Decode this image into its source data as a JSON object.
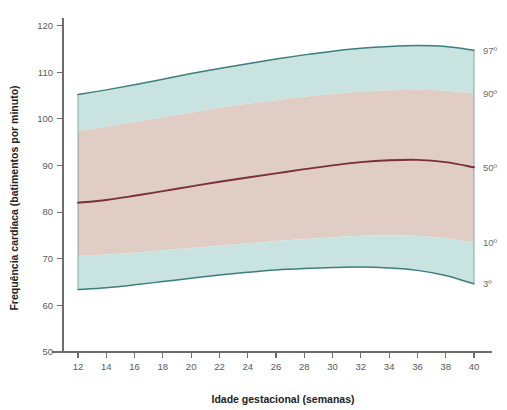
{
  "chart_data": {
    "type": "area",
    "title": "",
    "xlabel": "Idade gestacional (semanas)",
    "ylabel": "Frequência cardíaca (batimentos por minuto)",
    "xlim": [
      11,
      41
    ],
    "ylim": [
      50,
      122
    ],
    "xticks": [
      12,
      14,
      16,
      18,
      20,
      22,
      24,
      26,
      28,
      30,
      32,
      34,
      36,
      38,
      40
    ],
    "yticks": [
      50,
      60,
      70,
      80,
      90,
      100,
      110,
      120
    ],
    "grid": false,
    "legend_position": "right-axis-annotations",
    "x": [
      12,
      14,
      16,
      18,
      20,
      22,
      24,
      26,
      28,
      30,
      32,
      34,
      36,
      38,
      40
    ],
    "series": [
      {
        "name": "97º",
        "label": "97º",
        "color": "#3d7d7d",
        "kind": "band-upper-outer",
        "values": [
          105.2,
          106.2,
          107.3,
          108.5,
          109.7,
          110.8,
          111.8,
          112.8,
          113.7,
          114.5,
          115.1,
          115.5,
          115.7,
          115.5,
          114.7
        ]
      },
      {
        "name": "90º",
        "label": "90º",
        "color": "#3d7d7d",
        "kind": "band-upper-inner",
        "values": [
          97.4,
          98.3,
          99.3,
          100.3,
          101.3,
          102.3,
          103.2,
          104.0,
          104.7,
          105.3,
          105.8,
          106.1,
          106.2,
          106.0,
          105.4
        ]
      },
      {
        "name": "50º",
        "label": "50º",
        "color": "#7a2f3a",
        "kind": "median",
        "values": [
          82.0,
          82.6,
          83.5,
          84.5,
          85.5,
          86.5,
          87.4,
          88.3,
          89.2,
          90.0,
          90.7,
          91.1,
          91.2,
          90.7,
          89.6
        ]
      },
      {
        "name": "10º",
        "label": "10º",
        "color": "#3d7d7d",
        "kind": "band-lower-inner",
        "values": [
          70.6,
          70.9,
          71.3,
          71.8,
          72.3,
          72.8,
          73.3,
          73.8,
          74.2,
          74.6,
          74.9,
          75.0,
          74.9,
          74.4,
          73.4
        ]
      },
      {
        "name": "3º",
        "label": "3º",
        "color": "#3d7d7d",
        "kind": "band-lower-outer",
        "values": [
          63.4,
          63.8,
          64.4,
          65.1,
          65.8,
          66.5,
          67.1,
          67.6,
          67.9,
          68.1,
          68.2,
          68.0,
          67.5,
          66.4,
          64.6
        ]
      }
    ],
    "band_fills": {
      "outer": "#c9e4e0",
      "inner": "#e0cdc6"
    },
    "annotations": [
      {
        "name": "percentile-97",
        "text": "97º",
        "at_week": 40,
        "value": 114.7
      },
      {
        "name": "percentile-90",
        "text": "90º",
        "at_week": 40,
        "value": 105.4
      },
      {
        "name": "percentile-50",
        "text": "50º",
        "at_week": 40,
        "value": 89.6
      },
      {
        "name": "percentile-10",
        "text": "10º",
        "at_week": 40,
        "value": 73.4
      },
      {
        "name": "percentile-3",
        "text": "3º",
        "at_week": 40,
        "value": 64.6
      }
    ]
  },
  "axes": {
    "x_title": "Idade gestacional (semanas)",
    "y_title": "Frequência cardíaca (batimentos por minuto)",
    "x_tick_labels": [
      "12",
      "14",
      "16",
      "18",
      "20",
      "22",
      "24",
      "26",
      "28",
      "30",
      "32",
      "34",
      "36",
      "38",
      "40"
    ],
    "y_tick_labels": [
      "50",
      "60",
      "70",
      "80",
      "90",
      "100",
      "110",
      "120"
    ]
  },
  "percentile_labels": [
    "97º",
    "90º",
    "50º",
    "10º",
    "3º"
  ],
  "colors": {
    "outer_band": "#c9e4e0",
    "inner_band": "#e0cdc6",
    "band_outline": "#3d7d7d",
    "median_line": "#7a2f3a",
    "axis": "#6d6d6d",
    "tick_text": "#5a5a5a",
    "title_text": "#232323",
    "background": "#ffffff"
  }
}
